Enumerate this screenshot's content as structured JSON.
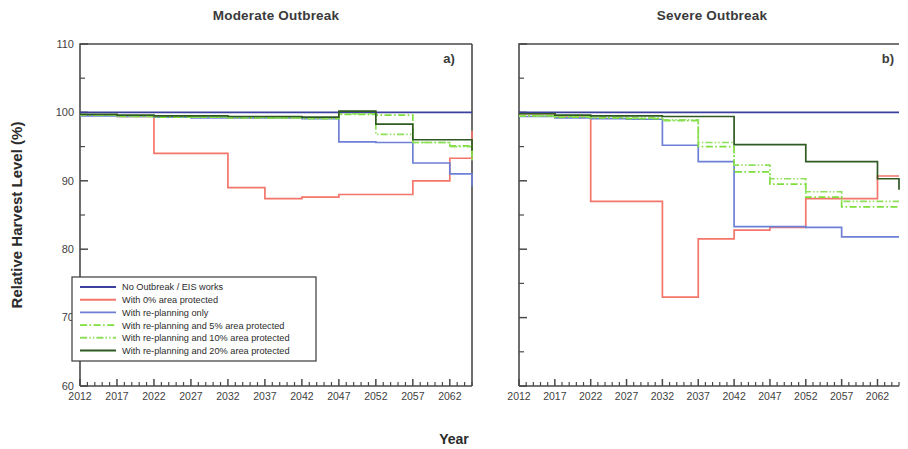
{
  "figure": {
    "x_axis_title": "Year",
    "y_axis_title": "Relative Harvest Level (%)"
  },
  "panels": [
    {
      "title": "Moderate Outbreak",
      "letter": "a)"
    },
    {
      "title": "Severe Outbreak",
      "letter": "b)"
    }
  ],
  "legend": {
    "items": [
      {
        "label": "No Outbreak / EIS works",
        "color": "#3b3f9e",
        "dash": "none"
      },
      {
        "label": "With 0% area protected",
        "color": "#f4766a",
        "dash": "none"
      },
      {
        "label": "With re-planning only",
        "color": "#6e7fd6",
        "dash": "none"
      },
      {
        "label": "With re-planning and 5% area protected",
        "color": "#7ede3c",
        "dash": "dashdot"
      },
      {
        "label": "With re-planning and 10% area protected",
        "color": "#8ee05a",
        "dash": "dashdotdot"
      },
      {
        "label": "With re-planning and 20% area protected",
        "color": "#2f5a23",
        "dash": "none"
      }
    ]
  },
  "chart_data": {
    "type": "line",
    "xlabel": "Year",
    "ylabel": "Relative Harvest Level (%)",
    "xlim": [
      2012,
      2065
    ],
    "ylim": [
      60,
      110
    ],
    "yticks": [
      60,
      70,
      80,
      90,
      100,
      110
    ],
    "yticks_minor": [
      65,
      75,
      85,
      95,
      105
    ],
    "xticks": [
      2012,
      2017,
      2022,
      2027,
      2032,
      2037,
      2042,
      2047,
      2052,
      2057,
      2062
    ],
    "grid": false,
    "legend_position": "lower-left-of-panel-a",
    "step_style": "post",
    "panels": [
      {
        "name": "Moderate Outbreak",
        "letter": "a)",
        "x": [
          2012,
          2017,
          2022,
          2027,
          2032,
          2037,
          2042,
          2047,
          2052,
          2057,
          2062,
          2065
        ],
        "series": [
          {
            "name": "No Outbreak / EIS works",
            "color": "#3b3f9e",
            "dash": "none",
            "values": [
              100,
              100,
              100,
              100,
              100,
              100,
              100,
              100,
              100,
              100,
              100,
              100
            ]
          },
          {
            "name": "With 0% area protected",
            "color": "#f4766a",
            "dash": "none",
            "values": [
              99.6,
              99.4,
              94.0,
              94.0,
              89.0,
              87.4,
              87.6,
              88.0,
              88.0,
              90.0,
              93.3,
              97.3
            ]
          },
          {
            "name": "With re-planning only",
            "color": "#6e7fd6",
            "dash": "none",
            "values": [
              99.5,
              99.4,
              99.3,
              99.2,
              99.2,
              99.2,
              99.1,
              95.7,
              95.6,
              92.6,
              91.0,
              89.2
            ]
          },
          {
            "name": "With re-planning and 5% area protected",
            "color": "#7ede3c",
            "dash": "dashdot",
            "values": [
              99.6,
              99.4,
              99.3,
              99.3,
              99.2,
              99.2,
              99.1,
              99.7,
              99.6,
              95.6,
              95.1,
              93.0
            ]
          },
          {
            "name": "With re-planning and 10% area protected",
            "color": "#8ee05a",
            "dash": "dashdotdot",
            "values": [
              99.6,
              99.5,
              99.4,
              99.3,
              99.3,
              99.2,
              99.2,
              99.8,
              96.8,
              95.6,
              95.0,
              93.0
            ]
          },
          {
            "name": "With re-planning and 20% area protected",
            "color": "#2f5a23",
            "dash": "none",
            "values": [
              99.7,
              99.6,
              99.5,
              99.5,
              99.4,
              99.4,
              99.3,
              100.2,
              98.3,
              96.0,
              96.0,
              94.4
            ]
          }
        ]
      },
      {
        "name": "Severe Outbreak",
        "letter": "b)",
        "x": [
          2012,
          2017,
          2022,
          2027,
          2032,
          2037,
          2042,
          2047,
          2052,
          2057,
          2062,
          2065
        ],
        "series": [
          {
            "name": "No Outbreak / EIS works",
            "color": "#3b3f9e",
            "dash": "none",
            "values": [
              100,
              100,
              100,
              100,
              100,
              100,
              100,
              100,
              100,
              100,
              100,
              100
            ]
          },
          {
            "name": "With 0% area protected",
            "color": "#f4766a",
            "dash": "none",
            "values": [
              99.8,
              99.5,
              87.0,
              87.0,
              73.0,
              81.5,
              82.8,
              83.2,
              87.4,
              87.4,
              90.7,
              90.7
            ]
          },
          {
            "name": "With re-planning only",
            "color": "#6e7fd6",
            "dash": "none",
            "values": [
              99.4,
              99.2,
              99.1,
              99.0,
              95.2,
              92.8,
              83.3,
              83.3,
              83.2,
              81.8,
              81.8,
              81.8
            ]
          },
          {
            "name": "With re-planning and 5% area protected",
            "color": "#7ede3c",
            "dash": "dashdot",
            "values": [
              99.5,
              99.3,
              99.2,
              99.1,
              98.8,
              95.0,
              91.3,
              89.5,
              87.6,
              86.2,
              86.2,
              86.2
            ]
          },
          {
            "name": "With re-planning and 10% area protected",
            "color": "#8ee05a",
            "dash": "dashdotdot",
            "values": [
              99.5,
              99.4,
              99.3,
              99.2,
              98.9,
              95.6,
              92.3,
              90.3,
              88.4,
              87.0,
              87.0,
              87.0
            ]
          },
          {
            "name": "With re-planning and 20% area protected",
            "color": "#2f5a23",
            "dash": "none",
            "values": [
              99.8,
              99.6,
              99.5,
              99.5,
              99.4,
              99.4,
              95.3,
              95.3,
              92.8,
              92.8,
              90.3,
              88.7
            ]
          }
        ]
      }
    ]
  }
}
